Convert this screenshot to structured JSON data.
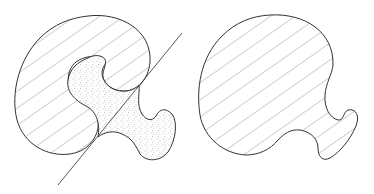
{
  "figure": {
    "panels": [
      {
        "id": "left",
        "elements": [
          "hatched-region",
          "stippled-region",
          "tangent-line"
        ]
      },
      {
        "id": "right",
        "elements": [
          "hatched-region"
        ]
      }
    ],
    "colors": {
      "stroke": "#333333",
      "hatch": "#888888",
      "stipple": "#9a9a9a",
      "background": "#ffffff"
    }
  }
}
